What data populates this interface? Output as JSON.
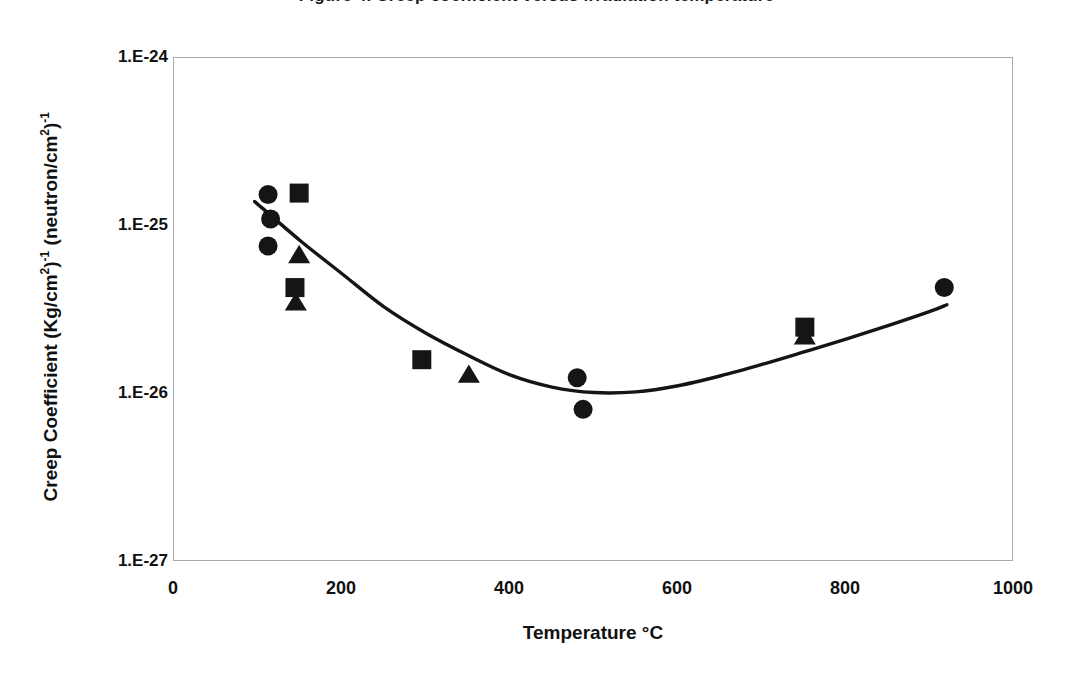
{
  "chart_data": {
    "type": "scatter",
    "title": "Figure 4. Creep coefficient versus irradiation temperature",
    "xlabel": "Temperature °C",
    "ylabel_main": "Creep Coefficient (Kg/cm",
    "ylabel_parts": {
      "seg1": "Creep Coefficient (Kg/cm",
      "sup1": "2",
      "seg2": ")",
      "sup2": "-1",
      "seg3": " (neutron/cm",
      "sup3": "2",
      "seg4": ")",
      "sup4": "-1"
    },
    "xlim": [
      0,
      1000
    ],
    "ylim": [
      1e-27,
      1e-24
    ],
    "yscale": "log",
    "xticks": [
      "0",
      "200",
      "400",
      "600",
      "800",
      "1000"
    ],
    "xtick_values": [
      0,
      200,
      400,
      600,
      800,
      1000
    ],
    "yticks": [
      "1.E-27",
      "1.E-26",
      "1.E-25",
      "1.E-24"
    ],
    "ytick_values": [
      1e-27,
      1e-26,
      1e-25,
      1e-24
    ],
    "grid": false,
    "legend": "none",
    "marker_color": "#151515",
    "line_color": "#151515",
    "frame_color": "#a9a9a9",
    "series": [
      {
        "name": "circle-series",
        "marker": "circle",
        "points": [
          {
            "x": 112,
            "y": 1.54e-25
          },
          {
            "x": 115,
            "y": 1.1e-25
          },
          {
            "x": 112,
            "y": 7.6e-26
          },
          {
            "x": 480,
            "y": 1.25e-26
          },
          {
            "x": 487,
            "y": 8.1e-27
          },
          {
            "x": 917,
            "y": 4.3e-26
          }
        ]
      },
      {
        "name": "square-series",
        "marker": "square",
        "points": [
          {
            "x": 149,
            "y": 1.57e-25
          },
          {
            "x": 144,
            "y": 4.3e-26
          },
          {
            "x": 295,
            "y": 1.6e-26
          },
          {
            "x": 751,
            "y": 2.5e-26
          }
        ]
      },
      {
        "name": "triangle-series",
        "marker": "triangle",
        "points": [
          {
            "x": 149,
            "y": 6.7e-26
          },
          {
            "x": 145,
            "y": 3.5e-26
          },
          {
            "x": 351,
            "y": 1.3e-26
          },
          {
            "x": 751,
            "y": 2.2e-26
          }
        ]
      },
      {
        "name": "fit-curve",
        "marker": "line",
        "points": [
          {
            "x": 96,
            "y": 1.4e-25
          },
          {
            "x": 150,
            "y": 8.2e-26
          },
          {
            "x": 200,
            "y": 5.2e-26
          },
          {
            "x": 250,
            "y": 3.3e-26
          },
          {
            "x": 300,
            "y": 2.3e-26
          },
          {
            "x": 350,
            "y": 1.7e-26
          },
          {
            "x": 400,
            "y": 1.3e-26
          },
          {
            "x": 450,
            "y": 1.1e-26
          },
          {
            "x": 500,
            "y": 1.02e-26
          },
          {
            "x": 550,
            "y": 1.03e-26
          },
          {
            "x": 600,
            "y": 1.12e-26
          },
          {
            "x": 650,
            "y": 1.28e-26
          },
          {
            "x": 700,
            "y": 1.5e-26
          },
          {
            "x": 750,
            "y": 1.78e-26
          },
          {
            "x": 800,
            "y": 2.12e-26
          },
          {
            "x": 850,
            "y": 2.55e-26
          },
          {
            "x": 900,
            "y": 3.1e-26
          },
          {
            "x": 920,
            "y": 3.4e-26
          }
        ]
      }
    ]
  }
}
